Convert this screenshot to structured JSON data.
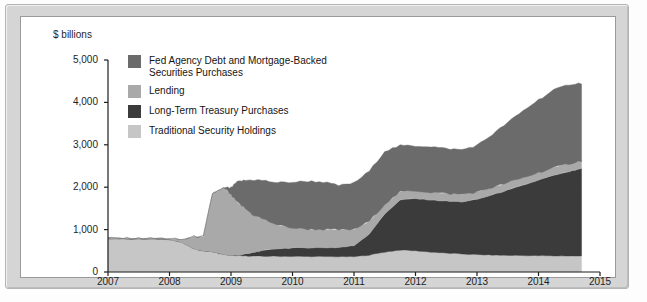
{
  "figure": {
    "axis_unit_label": "$ billions",
    "bleed_through_text": {
      "line_a": "Inside the Fed",
      "line_b": "A Monetary Policy Change",
      "line_c": "Potential Costs",
      "line_d": "economic growth",
      "line_e": "Federal Reserve"
    }
  },
  "colors": {
    "fed_agency": "#6b6b6b",
    "lending": "#a9a9a9",
    "long_term_treasury": "#3b3b3b",
    "traditional": "#c6c6c6",
    "axis": "#1e1e1e",
    "frame": "#d5d5d5",
    "plate": "#ffffff"
  },
  "chart_data": {
    "type": "area",
    "stacked": true,
    "title": "",
    "subtitle": "",
    "xlabel": "",
    "ylabel": "$ billions",
    "xlim": [
      2007,
      2015
    ],
    "ylim": [
      0,
      5000
    ],
    "grid": false,
    "legend_position": "inside-top-left",
    "xticks": [
      "2007",
      "2008",
      "2009",
      "2010",
      "2011",
      "2012",
      "2013",
      "2014",
      "2015"
    ],
    "yticks": [
      "0",
      "1,000",
      "2,000",
      "3,000",
      "4,000",
      "5,000"
    ],
    "x_unit": "year",
    "y_unit": "billions of US dollars",
    "stack_order_bottom_to_top": [
      "Traditional Security Holdings",
      "Long-Term Treasury Purchases",
      "Lending",
      "Fed Agency Debt and Mortgage-Backed Securities Purchases"
    ],
    "x": [
      2007.0,
      2007.25,
      2007.5,
      2007.75,
      2008.0,
      2008.2,
      2008.4,
      2008.55,
      2008.7,
      2008.8,
      2008.9,
      2009.0,
      2009.1,
      2009.2,
      2009.35,
      2009.5,
      2009.75,
      2010.0,
      2010.25,
      2010.5,
      2010.75,
      2011.0,
      2011.25,
      2011.5,
      2011.75,
      2012.0,
      2012.25,
      2012.5,
      2012.75,
      2013.0,
      2013.25,
      2013.5,
      2013.75,
      2014.0,
      2014.25,
      2014.5,
      2014.7
    ],
    "series": [
      {
        "name": "Traditional Security Holdings",
        "color": "#c6c6c6",
        "values": [
          790,
          785,
          780,
          778,
          770,
          700,
          545,
          500,
          480,
          440,
          410,
          395,
          385,
          380,
          375,
          372,
          370,
          368,
          366,
          364,
          362,
          360,
          400,
          470,
          520,
          500,
          470,
          445,
          425,
          410,
          400,
          392,
          388,
          384,
          380,
          378,
          376
        ]
      },
      {
        "name": "Long-Term Treasury Purchases",
        "color": "#3b3b3b",
        "values": [
          0,
          0,
          0,
          0,
          0,
          0,
          0,
          0,
          0,
          0,
          0,
          0,
          10,
          35,
          80,
          130,
          180,
          200,
          205,
          210,
          215,
          260,
          500,
          900,
          1180,
          1230,
          1230,
          1225,
          1230,
          1300,
          1420,
          1540,
          1660,
          1780,
          1900,
          1990,
          2060
        ]
      },
      {
        "name": "Lending",
        "color": "#a9a9a9",
        "values": [
          10,
          10,
          12,
          14,
          18,
          60,
          290,
          330,
          1380,
          1480,
          1560,
          1420,
          1250,
          1120,
          900,
          760,
          560,
          470,
          440,
          430,
          420,
          380,
          300,
          230,
          190,
          185,
          180,
          180,
          178,
          176,
          175,
          175,
          175,
          178,
          182,
          188,
          190
        ]
      },
      {
        "name": "Fed Agency Debt and Mortgage-Backed Securities Purchases",
        "color": "#6b6b6b",
        "values": [
          0,
          0,
          0,
          0,
          0,
          0,
          0,
          0,
          0,
          0,
          20,
          170,
          480,
          620,
          820,
          900,
          1000,
          1080,
          1130,
          1120,
          1040,
          1100,
          1180,
          1250,
          1090,
          1060,
          1080,
          1060,
          1050,
          1100,
          1250,
          1420,
          1580,
          1720,
          1830,
          1870,
          1830
        ]
      }
    ],
    "total_start": 800,
    "total_peak_2008": 2250,
    "total_end": 4450
  },
  "legend": {
    "items": [
      {
        "label": "Fed Agency Debt and Mortgage-Backed\nSecurities Purchases",
        "color": "#6b6b6b"
      },
      {
        "label": "Lending",
        "color": "#a9a9a9"
      },
      {
        "label": "Long-Term Treasury Purchases",
        "color": "#3b3b3b"
      },
      {
        "label": "Traditional Security Holdings",
        "color": "#c6c6c6"
      }
    ]
  }
}
